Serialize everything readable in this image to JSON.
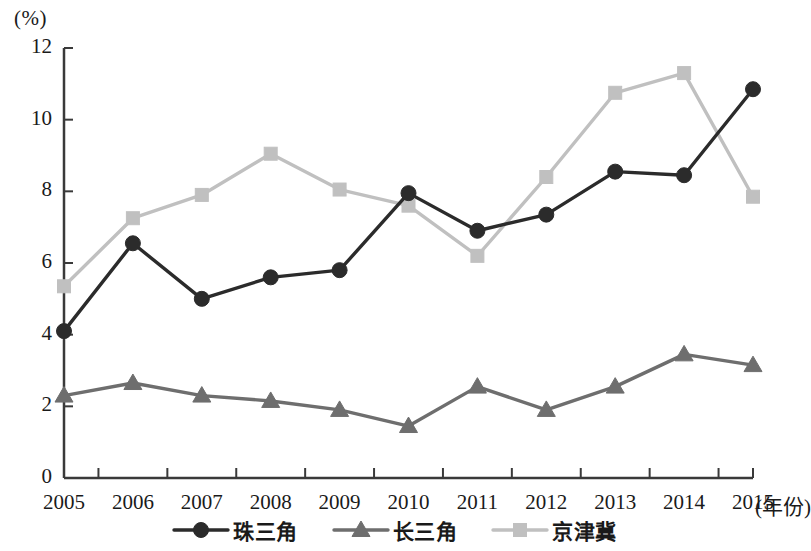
{
  "axis": {
    "unit_label": "(%)",
    "x_title": "(年份)",
    "y_ticks": [
      "0",
      "2",
      "4",
      "6",
      "8",
      "10",
      "12"
    ]
  },
  "legend": {
    "items": [
      {
        "label": "珠三角",
        "marker": "circle-marker",
        "color": "#2b2b2b"
      },
      {
        "label": "长三角",
        "marker": "triangle-marker",
        "color": "#6e6e6e"
      },
      {
        "label": "京津冀",
        "marker": "square-marker",
        "color": "#c0c0c0"
      }
    ]
  },
  "chart_data": {
    "type": "line",
    "title": "",
    "xlabel": "(年份)",
    "ylabel": "(%)",
    "ylim": [
      0,
      12
    ],
    "ytick_step": 2,
    "grid": false,
    "legend_position": "bottom",
    "categories": [
      "2005",
      "2006",
      "2007",
      "2008",
      "2009",
      "2010",
      "2011",
      "2012",
      "2013",
      "2014",
      "2015"
    ],
    "series": [
      {
        "name": "珠三角",
        "marker": "circle",
        "color": "#2b2b2b",
        "values": [
          4.1,
          6.55,
          5.0,
          5.6,
          5.8,
          7.95,
          6.9,
          7.35,
          8.55,
          8.45,
          10.85
        ]
      },
      {
        "name": "长三角",
        "marker": "triangle",
        "color": "#6e6e6e",
        "values": [
          2.3,
          2.65,
          2.3,
          2.15,
          1.9,
          1.45,
          2.55,
          1.9,
          2.55,
          3.45,
          3.15
        ]
      },
      {
        "name": "京津冀",
        "marker": "square",
        "color": "#c0c0c0",
        "values": [
          5.35,
          7.25,
          7.9,
          9.05,
          8.05,
          7.6,
          6.2,
          8.4,
          10.75,
          11.3,
          7.85
        ]
      }
    ]
  }
}
